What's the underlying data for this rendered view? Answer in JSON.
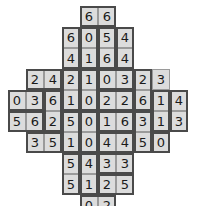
{
  "puzzle": {
    "kind": "domino-grid",
    "cell_width": 18,
    "cell_height": 21,
    "origin_x": 8,
    "origin_y": 6,
    "columns": 10,
    "rows": 11,
    "colors": {
      "cell_fill": "#dcdcdc",
      "cell_border": "#9a9a9a",
      "domino_border": "#4a4a4a",
      "text": "#1a1a1a",
      "background": "#ffffff"
    },
    "rows_data": [
      {
        "row": 0,
        "start_col": 4,
        "values": [
          "6",
          "6"
        ]
      },
      {
        "row": 1,
        "start_col": 3,
        "values": [
          "6",
          "0",
          "5",
          "4"
        ]
      },
      {
        "row": 2,
        "start_col": 3,
        "values": [
          "4",
          "1",
          "6",
          "4"
        ]
      },
      {
        "row": 3,
        "start_col": 1,
        "values": [
          "2",
          "4",
          "2",
          "1",
          "0",
          "3",
          "2",
          "3"
        ]
      },
      {
        "row": 4,
        "start_col": 0,
        "values": [
          "0",
          "3",
          "6",
          "1",
          "0",
          "2",
          "2",
          "6",
          "1",
          "4"
        ]
      },
      {
        "row": 5,
        "start_col": 0,
        "values": [
          "5",
          "6",
          "2",
          "5",
          "0",
          "1",
          "6",
          "3",
          "1",
          "3"
        ]
      },
      {
        "row": 6,
        "start_col": 1,
        "values": [
          "3",
          "5",
          "1",
          "0",
          "4",
          "4",
          "5",
          "0"
        ]
      },
      {
        "row": 7,
        "start_col": 3,
        "values": [
          "5",
          "4",
          "3",
          "3"
        ]
      },
      {
        "row": 8,
        "start_col": 3,
        "values": [
          "5",
          "1",
          "2",
          "5"
        ]
      },
      {
        "row": 9,
        "start_col": 4,
        "values": [
          "0",
          "2"
        ]
      }
    ],
    "dominoes": [
      {
        "row": 0,
        "col": 4,
        "w": 2,
        "h": 1
      },
      {
        "row": 1,
        "col": 3,
        "w": 1,
        "h": 2
      },
      {
        "row": 1,
        "col": 4,
        "w": 1,
        "h": 2
      },
      {
        "row": 1,
        "col": 5,
        "w": 1,
        "h": 2
      },
      {
        "row": 1,
        "col": 6,
        "w": 1,
        "h": 2
      },
      {
        "row": 3,
        "col": 1,
        "w": 2,
        "h": 1
      },
      {
        "row": 3,
        "col": 3,
        "w": 1,
        "h": 2
      },
      {
        "row": 3,
        "col": 4,
        "w": 1,
        "h": 2
      },
      {
        "row": 3,
        "col": 5,
        "w": 2,
        "h": 1
      },
      {
        "row": 3,
        "col": 7,
        "w": 1,
        "h": 2
      },
      {
        "row": 4,
        "col": 0,
        "w": 2,
        "h": 1
      },
      {
        "row": 4,
        "col": 2,
        "w": 1,
        "h": 2
      },
      {
        "row": 4,
        "col": 5,
        "w": 2,
        "h": 1
      },
      {
        "row": 4,
        "col": 8,
        "w": 1,
        "h": 2
      },
      {
        "row": 4,
        "col": 9,
        "w": 1,
        "h": 2
      },
      {
        "row": 5,
        "col": 0,
        "w": 2,
        "h": 1
      },
      {
        "row": 5,
        "col": 3,
        "w": 1,
        "h": 2
      },
      {
        "row": 5,
        "col": 4,
        "w": 1,
        "h": 2
      },
      {
        "row": 5,
        "col": 5,
        "w": 2,
        "h": 1
      },
      {
        "row": 5,
        "col": 7,
        "w": 1,
        "h": 2
      },
      {
        "row": 6,
        "col": 1,
        "w": 2,
        "h": 1
      },
      {
        "row": 6,
        "col": 5,
        "w": 2,
        "h": 1
      },
      {
        "row": 6,
        "col": 8,
        "w": 1,
        "h": 1
      },
      {
        "row": 7,
        "col": 3,
        "w": 1,
        "h": 2
      },
      {
        "row": 7,
        "col": 4,
        "w": 1,
        "h": 2
      },
      {
        "row": 7,
        "col": 5,
        "w": 2,
        "h": 1
      },
      {
        "row": 8,
        "col": 5,
        "w": 2,
        "h": 1
      },
      {
        "row": 9,
        "col": 4,
        "w": 2,
        "h": 1
      }
    ]
  }
}
